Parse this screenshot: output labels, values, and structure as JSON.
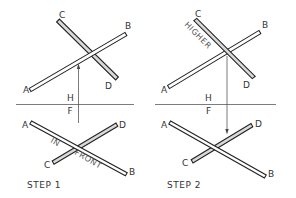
{
  "figure": {
    "panels": [
      {
        "step_label": "STEP 1",
        "top_view": {
          "labels": {
            "A": "A",
            "B": "B",
            "C": "C",
            "D": "D"
          },
          "front_rod": "AB",
          "back_rod": "CD",
          "arrow_direction": "up"
        },
        "fold_line": {
          "upper": "H",
          "lower": "F"
        },
        "front_view": {
          "labels": {
            "A": "A",
            "B": "B",
            "C": "C",
            "D": "D"
          },
          "annotation_1": "IN",
          "annotation_2": "FRONT"
        }
      },
      {
        "step_label": "STEP 2",
        "top_view": {
          "labels": {
            "A": "A",
            "B": "B",
            "C": "C",
            "D": "D"
          },
          "annotation": "HIGHER",
          "arrow_direction": "down"
        },
        "fold_line": {
          "upper": "H",
          "lower": "F"
        },
        "front_view": {
          "labels": {
            "A": "A",
            "B": "B",
            "C": "C",
            "D": "D"
          }
        }
      }
    ]
  },
  "colors": {
    "outline": "#222222",
    "shaded_rod": "#d9d9d9",
    "background": "#ffffff"
  }
}
